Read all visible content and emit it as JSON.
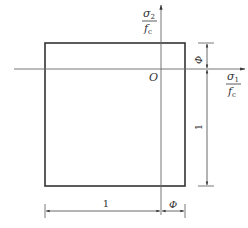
{
  "diagram": {
    "type": "failure-envelope-square",
    "axes": {
      "vertical": {
        "numerator": "σ",
        "numerator_sub": "2",
        "denominator": "f",
        "denominator_sub": "c"
      },
      "horizontal": {
        "numerator": "σ",
        "numerator_sub": "1",
        "denominator": "f",
        "denominator_sub": "c"
      },
      "origin_label": "O"
    },
    "dimensions": {
      "bottom_left": "1",
      "bottom_right": "Φ",
      "right_top": "Φ",
      "right_bottom": "1"
    },
    "colors": {
      "box": "#333333",
      "axes": "#555555",
      "dimension": "#444444"
    }
  }
}
